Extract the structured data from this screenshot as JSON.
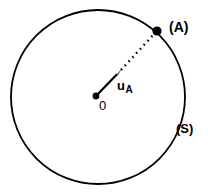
{
  "figure": {
    "background_color": "#ffffff",
    "stroke_color": "#000000",
    "width": 208,
    "height": 192
  },
  "circle": {
    "name": "circle-S",
    "center_x": 98,
    "center_y": 97,
    "radius": 87,
    "stroke_width": 1.8
  },
  "points": {
    "origin": {
      "label": "0",
      "x": 96,
      "y": 96,
      "dot_radius": 3.4
    },
    "point_a": {
      "label": "(A)",
      "x": 157,
      "y": 31,
      "dot_radius": 4.6
    }
  },
  "vector": {
    "label_main": "u",
    "label_sub": "A",
    "from_x": 96,
    "from_y": 96,
    "to_x": 121,
    "to_y": 70,
    "stroke_width": 2.2
  },
  "dotted_line": {
    "name": "radius-dotted-segment",
    "from_x": 121,
    "from_y": 70,
    "to_x": 155,
    "to_y": 33,
    "dash": "1.6 4.0",
    "stroke_width": 2.4
  },
  "labels": {
    "curve_label": "(S)",
    "point_label": "(A)",
    "origin_label": "0"
  }
}
